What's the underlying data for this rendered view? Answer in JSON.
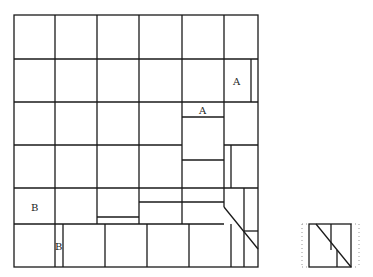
{
  "diagram": {
    "type": "tiling-grid",
    "grid": {
      "rows": 6,
      "cols": 6
    },
    "labels": [
      {
        "id": "label-a-top",
        "text": "A"
      },
      {
        "id": "label-a-mid",
        "text": "A"
      },
      {
        "id": "label-b-left",
        "text": "B"
      },
      {
        "id": "label-b-bottom",
        "text": "B"
      }
    ],
    "line_color": "#1a1a1a",
    "background": "#ffffff"
  },
  "inset": {
    "description": "small square piece with diagonal cut"
  }
}
